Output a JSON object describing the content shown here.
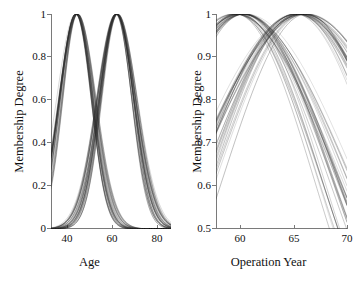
{
  "figure": {
    "caption": "",
    "background": "#ffffff",
    "curve_color": "#2b2b2b"
  },
  "chart_data": [
    {
      "type": "line",
      "id": "age-membership",
      "title": "",
      "xlabel": "Age",
      "ylabel": "Membership Degree",
      "xlim": [
        33,
        84
      ],
      "ylim": [
        0,
        1
      ],
      "xticks": [
        40,
        60,
        80
      ],
      "xtick_labels": [
        "40",
        "60",
        "80"
      ],
      "yticks": [
        0,
        0.2,
        0.4,
        0.6,
        0.8,
        1
      ],
      "ytick_labels": [
        "0",
        "0.2",
        "0.4",
        "0.6",
        "0.8",
        "1"
      ],
      "grid": false,
      "legend": "none",
      "description": "Ensemble of Gaussian membership functions: two overlapping bell-shaped bundles peaking near Age 44 and Age 61, crossing at about 0.57 near Age 53",
      "series": [
        {
          "name": "Low Age cluster (ensemble)",
          "shape": "gaussian",
          "peak_x": 44.0,
          "peak_y": 1.0,
          "sigma_range": [
            6.2,
            8.0
          ],
          "n_lines": 30,
          "x": [
            33,
            36,
            39,
            42,
            44,
            47,
            50,
            53,
            56,
            59,
            62,
            65,
            68,
            71,
            74,
            77,
            80,
            83
          ],
          "y": [
            0.3,
            0.52,
            0.76,
            0.96,
            1.0,
            0.93,
            0.76,
            0.55,
            0.35,
            0.19,
            0.09,
            0.04,
            0.015,
            0.005,
            0.002,
            0.001,
            0.0,
            0.0
          ]
        },
        {
          "name": "High Age cluster (ensemble)",
          "shape": "gaussian",
          "peak_x": 61.0,
          "peak_y": 1.0,
          "sigma_range": [
            6.5,
            8.5
          ],
          "n_lines": 30,
          "x": [
            33,
            36,
            39,
            42,
            44,
            47,
            50,
            53,
            56,
            59,
            61,
            64,
            67,
            70,
            73,
            76,
            79,
            83
          ],
          "y": [
            0.0,
            0.002,
            0.008,
            0.03,
            0.06,
            0.13,
            0.26,
            0.45,
            0.7,
            0.94,
            1.0,
            0.95,
            0.8,
            0.59,
            0.38,
            0.21,
            0.11,
            0.04
          ]
        }
      ]
    },
    {
      "type": "line",
      "id": "operation-year-membership",
      "title": "",
      "xlabel": "Operation Year",
      "ylabel": "Membership Degree",
      "xlim": [
        57.8,
        70
      ],
      "ylim": [
        0.5,
        1
      ],
      "xticks": [
        60,
        65,
        70
      ],
      "xtick_labels": [
        "60",
        "65",
        "70"
      ],
      "yticks": [
        0.5,
        0.6,
        0.7,
        0.8,
        0.9,
        1
      ],
      "ytick_labels": [
        "0.5",
        "0.6",
        "0.7",
        "0.8",
        "0.9",
        "1"
      ],
      "grid": false,
      "legend": "none",
      "description": "Ensemble of broad Gaussian membership functions: one bundle peaking near Operation Year 60 and descending to about 0.58-0.72 by year 69, the other rising from about 0.75 and peaking near year 65.7 then falling slightly to about 0.95",
      "series": [
        {
          "name": "Early Operation Year cluster (ensemble)",
          "shape": "gaussian",
          "peak_x": 60.0,
          "peak_y": 1.0,
          "sigma_range": [
            7.5,
            10.5
          ],
          "n_lines": 30,
          "x": [
            57.8,
            58.5,
            59.2,
            60.0,
            61.0,
            62.0,
            63.0,
            64.0,
            65.0,
            66.0,
            67.0,
            68.0,
            69.0
          ],
          "y": [
            0.985,
            0.995,
            0.999,
            1.0,
            0.997,
            0.988,
            0.972,
            0.948,
            0.912,
            0.862,
            0.795,
            0.712,
            0.62
          ]
        },
        {
          "name": "Late Operation Year cluster (ensemble)",
          "shape": "gaussian",
          "peak_x": 65.7,
          "peak_y": 1.0,
          "sigma_range": [
            8.0,
            11.0
          ],
          "n_lines": 30,
          "x": [
            57.8,
            58.5,
            59.5,
            60.5,
            61.5,
            62.5,
            63.5,
            64.5,
            65.7,
            66.5,
            67.5,
            68.5,
            69.0
          ],
          "y": [
            0.775,
            0.82,
            0.875,
            0.92,
            0.955,
            0.978,
            0.992,
            0.999,
            1.0,
            0.996,
            0.985,
            0.968,
            0.958
          ]
        }
      ]
    }
  ]
}
